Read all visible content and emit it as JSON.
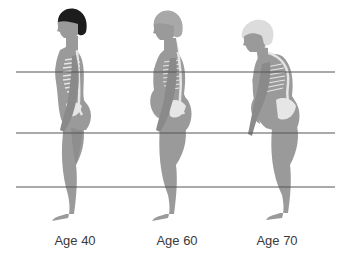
{
  "diagram": {
    "colors": {
      "body": "#9a9a9a",
      "body_dark": "#7f7f7f",
      "line": "#555555",
      "hair_age40": "#1c1c1c",
      "hair_age60": "#a8a8a8",
      "hair_age70": "#dcdcdc",
      "bone": "#e6e6e6",
      "label": "#3a3a3a"
    },
    "reference_lines": [
      {
        "y": 72,
        "x1": 16,
        "x2": 335
      },
      {
        "y": 133,
        "x1": 16,
        "x2": 335
      },
      {
        "y": 187,
        "x1": 16,
        "x2": 335
      }
    ],
    "figures": [
      {
        "label": "Age 40",
        "center_x": 70,
        "hair": "dark",
        "posture": "upright"
      },
      {
        "label": "Age 60",
        "center_x": 170,
        "hair": "gray",
        "posture": "slightly stooped"
      },
      {
        "label": "Age 70",
        "center_x": 272,
        "hair": "white",
        "posture": "stooped with rounded upper back"
      }
    ]
  }
}
